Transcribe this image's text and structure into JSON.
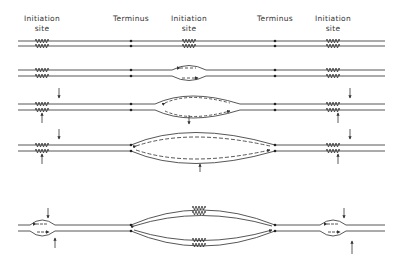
{
  "labels": {
    "initiation_left": [
      "Initiation",
      "site"
    ],
    "terminus_left": "Terminus",
    "initiation_center": [
      "Initiation",
      "site"
    ],
    "terminus_right": "Terminus",
    "initiation_right": [
      "Initiation",
      "site"
    ]
  },
  "layout": {
    "initiation_sites_x": [
      42,
      189,
      333
    ],
    "termini_x": [
      131,
      275
    ],
    "row_center_y": [
      43,
      73,
      107,
      148,
      228
    ]
  },
  "stages": [
    {
      "index": 1,
      "description": "Unreplicated duplex; initiation sites and termini marked"
    },
    {
      "index": 2,
      "description": "Replication bubble opened at central initiation site"
    },
    {
      "index": 3,
      "description": "Bubble expanding bidirectionally; arrows mark flanking initiation sites"
    },
    {
      "index": 4,
      "description": "Forks reached termini"
    },
    {
      "index": 5,
      "description": "Replication complete in central unit; new bubbles at flanking initiation sites"
    }
  ]
}
